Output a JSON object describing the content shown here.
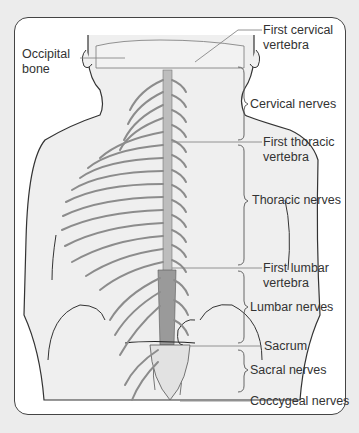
{
  "diagram": {
    "labels": {
      "occipital_bone": [
        "Occipital",
        "bone"
      ],
      "first_cervical_vertebra": [
        "First cervical",
        "vertebra"
      ],
      "cervical_nerves": "Cervical nerves",
      "first_thoracic_vertebra": [
        "First thoracic",
        "vertebra"
      ],
      "thoracic_nerves": "Thoracic nerves",
      "first_lumbar_vertebra": [
        "First lumbar",
        "vertebra"
      ],
      "lumbar_nerves": "Lumbar nerves",
      "sacrum": "Sacrum",
      "sacral_nerves": "Sacral nerves",
      "coccygeal_nerves": "Coccygeal nerves"
    },
    "colors": {
      "background": "#ececec",
      "frame_border": "#444444",
      "body_fill": "#eeeeee",
      "outline": "#333333",
      "nerve": "#888888",
      "leader_line": "#888888",
      "text": "#333333"
    }
  }
}
